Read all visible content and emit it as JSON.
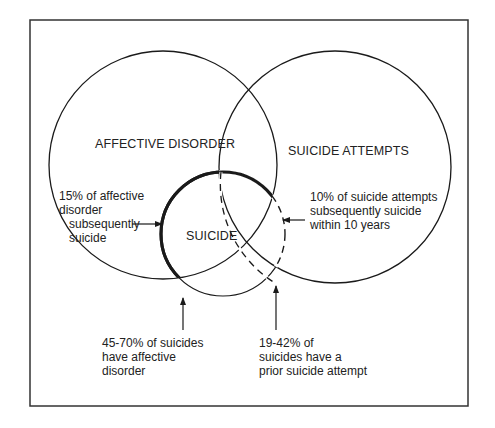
{
  "diagram": {
    "type": "venn",
    "sets": [
      {
        "id": "affective",
        "label": "AFFECTIVE DISORDER"
      },
      {
        "id": "attempts",
        "label": "SUICIDE ATTEMPTS"
      },
      {
        "id": "suicide",
        "label": "SUICIDE"
      }
    ],
    "annotations": {
      "affective_to_suicide": "15% of affective\ndisorder\n   subsequently\n   suicide",
      "attempts_to_suicide": "10% of suicide attempts\nsubsequently suicide\nwithin 10 years",
      "suicides_affective": "45-70% of suicides\nhave affective\ndisorder",
      "suicides_attempt": "19-42% of\nsuicides have a\nprior suicide attempt"
    },
    "colors": {
      "line": "#1a1a1a",
      "background": "#ffffff"
    }
  }
}
